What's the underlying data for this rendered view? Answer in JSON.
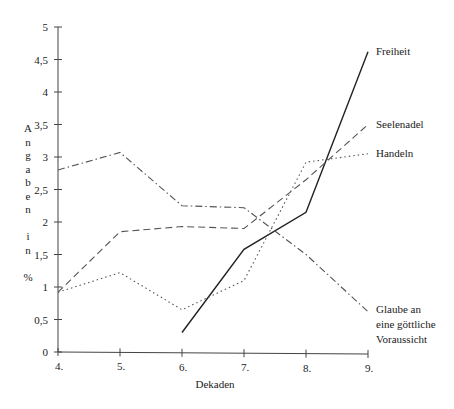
{
  "chart_data": {
    "type": "line",
    "title": "",
    "xlabel": "Dekaden",
    "ylabel": "Angaben in %",
    "ylabel_chars": [
      "A",
      "n",
      "g",
      "a",
      "b",
      "e",
      "n",
      "",
      "i",
      "n",
      "",
      "%"
    ],
    "categories": [
      "4.",
      "5.",
      "6.",
      "7.",
      "8.",
      "9."
    ],
    "y_ticks": [
      "0",
      "0,5",
      "1",
      "1,5",
      "2",
      "2,5",
      "3",
      "3,5",
      "4",
      "4,5",
      "5"
    ],
    "ylim": [
      0,
      5
    ],
    "grid": false,
    "legend_position": "inline-right",
    "series": [
      {
        "name": "Freiheit",
        "style": "solid",
        "values": [
          null,
          null,
          0.3,
          1.58,
          2.15,
          4.62
        ]
      },
      {
        "name": "Seelenadel",
        "style": "dashed",
        "values": [
          0.92,
          1.85,
          1.93,
          1.9,
          2.65,
          3.5
        ]
      },
      {
        "name": "Handeln",
        "style": "dotted",
        "values": [
          0.92,
          1.22,
          0.65,
          1.1,
          2.92,
          3.05
        ]
      },
      {
        "name": "Glaube an eine göttliche Voraussicht",
        "label_lines": [
          "Glaube an",
          "eine göttliche",
          "Voraussicht"
        ],
        "style": "dashdot",
        "values": [
          2.8,
          3.07,
          2.25,
          2.22,
          1.5,
          0.62
        ]
      }
    ]
  }
}
